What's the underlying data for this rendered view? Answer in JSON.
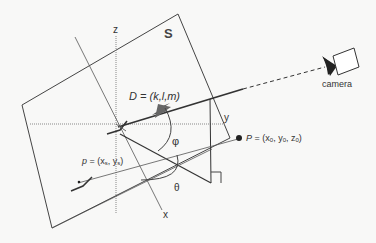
{
  "diagram": {
    "plane_label": "S",
    "axes": {
      "x": "x",
      "y": "y",
      "z": "z"
    },
    "direction_vector": {
      "label": "D = (k,l,m)"
    },
    "point_P": {
      "label_var": "P",
      "label_eq": " = (x",
      "sub0": "0",
      "comma1": ", y",
      "sub1": "0",
      "comma2": ", z",
      "sub2": "0",
      "close": ")"
    },
    "point_p": {
      "label_var": "p",
      "label_eq": " = (x",
      "sub0": "s",
      "comma1": ", y",
      "sub1": "s",
      "close": ")"
    },
    "angles": {
      "phi": "φ",
      "theta": "θ"
    },
    "camera_label": "camera",
    "colors": {
      "line": "#444444",
      "dotted": "#888888",
      "arrow": "#555555",
      "fill_dark": "#222222"
    }
  }
}
